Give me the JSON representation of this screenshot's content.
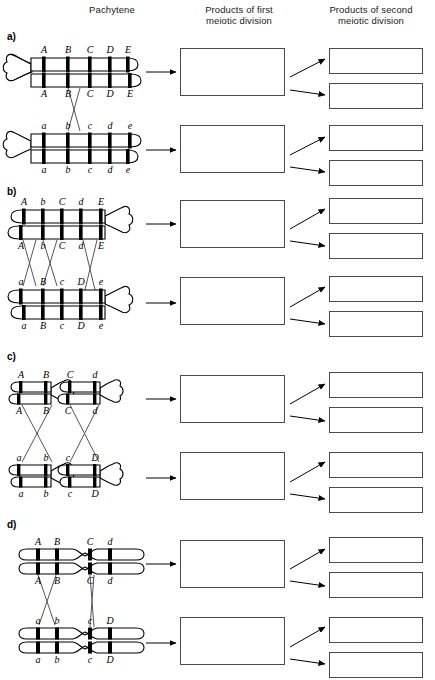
{
  "figure": {
    "headers": {
      "pachytene": "Pachytene",
      "first_division": "Products of first\nmeiotic division",
      "second_division": "Products of second\nmeiotic division"
    },
    "colors": {
      "ink": "#000000",
      "box_border": "#4a4a4a",
      "band": "#000000",
      "outline": "#000000",
      "background": "#ffffff"
    }
  },
  "panels": [
    {
      "id": "a",
      "label": "a)",
      "centromere_position": "left",
      "chromosome_type": "acrocentric",
      "bivalents": [
        {
          "name": "upper-homolog",
          "chromatids": [
            {
              "name": "chromatid-1",
              "alleles": [
                "A",
                "B",
                "C",
                "D",
                "E"
              ],
              "label_position": "above"
            },
            {
              "name": "chromatid-2",
              "alleles": [
                "A",
                "B",
                "C",
                "D",
                "E"
              ],
              "label_position": "below"
            }
          ]
        },
        {
          "name": "lower-homolog",
          "chromatids": [
            {
              "name": "chromatid-3",
              "alleles": [
                "a",
                "b",
                "c",
                "d",
                "e"
              ],
              "label_position": "above"
            },
            {
              "name": "chromatid-4",
              "alleles": [
                "a",
                "b",
                "c",
                "d",
                "e"
              ],
              "label_position": "below"
            }
          ]
        }
      ],
      "crossovers": [
        {
          "name": "crossover-1",
          "between": "B-C"
        }
      ],
      "first_division_boxes": [
        "",
        ""
      ],
      "second_division_boxes": [
        "",
        "",
        "",
        ""
      ]
    },
    {
      "id": "b",
      "label": "b)",
      "centromere_position": "right",
      "chromosome_type": "acrocentric",
      "bivalents": [
        {
          "name": "upper-homolog",
          "chromatids": [
            {
              "name": "chromatid-1",
              "alleles": [
                "A",
                "b",
                "C",
                "d",
                "E"
              ],
              "label_position": "above"
            },
            {
              "name": "chromatid-2",
              "alleles": [
                "A",
                "b",
                "C",
                "d",
                "E"
              ],
              "label_position": "below"
            }
          ]
        },
        {
          "name": "lower-homolog",
          "chromatids": [
            {
              "name": "chromatid-3",
              "alleles": [
                "a",
                "B",
                "c",
                "D",
                "e"
              ],
              "label_position": "above"
            },
            {
              "name": "chromatid-4",
              "alleles": [
                "a",
                "B",
                "c",
                "D",
                "e"
              ],
              "label_position": "below"
            }
          ]
        }
      ],
      "crossovers": [
        {
          "name": "crossover-1",
          "between": "A-b"
        },
        {
          "name": "crossover-2",
          "between": "b-C"
        },
        {
          "name": "crossover-3",
          "between": "d-E"
        }
      ],
      "first_division_boxes": [
        "",
        ""
      ],
      "second_division_boxes": [
        "",
        "",
        "",
        ""
      ]
    },
    {
      "id": "c",
      "label": "c)",
      "centromere_position": "right",
      "chromosome_type": "acrocentric-pair",
      "bivalents": [
        {
          "name": "upper-homolog-left",
          "chromatids": [
            {
              "name": "chromatid-1",
              "alleles": [
                "A",
                "B"
              ],
              "label_position": "above"
            },
            {
              "name": "chromatid-2",
              "alleles": [
                "A",
                "B"
              ],
              "label_position": "below"
            }
          ]
        },
        {
          "name": "upper-homolog-right",
          "chromatids": [
            {
              "name": "chromatid-1",
              "alleles": [
                "C",
                "d"
              ],
              "label_position": "above"
            },
            {
              "name": "chromatid-2",
              "alleles": [
                "C",
                "d"
              ],
              "label_position": "below"
            }
          ]
        },
        {
          "name": "lower-homolog-left",
          "chromatids": [
            {
              "name": "chromatid-3",
              "alleles": [
                "a",
                "b"
              ],
              "label_position": "above"
            },
            {
              "name": "chromatid-4",
              "alleles": [
                "a",
                "b"
              ],
              "label_position": "below"
            }
          ]
        },
        {
          "name": "lower-homolog-right",
          "chromatids": [
            {
              "name": "chromatid-3",
              "alleles": [
                "c",
                "D"
              ],
              "label_position": "above"
            },
            {
              "name": "chromatid-4",
              "alleles": [
                "c",
                "D"
              ],
              "label_position": "below"
            }
          ]
        }
      ],
      "crossovers": [
        {
          "name": "crossover-left",
          "between": "A-B"
        },
        {
          "name": "crossover-right",
          "between": "C-d"
        }
      ],
      "first_division_boxes": [
        "",
        ""
      ],
      "second_division_boxes": [
        "",
        "",
        "",
        ""
      ]
    },
    {
      "id": "d",
      "label": "d)",
      "centromere_position": "middle",
      "chromosome_type": "metacentric",
      "bivalents": [
        {
          "name": "upper-homolog",
          "chromatids": [
            {
              "name": "chromatid-1",
              "alleles": [
                "A",
                "B",
                "C",
                "d"
              ],
              "label_position": "above"
            },
            {
              "name": "chromatid-2",
              "alleles": [
                "A",
                "B",
                "C",
                "d"
              ],
              "label_position": "below"
            }
          ]
        },
        {
          "name": "lower-homolog",
          "chromatids": [
            {
              "name": "chromatid-3",
              "alleles": [
                "a",
                "b",
                "c",
                "D"
              ],
              "label_position": "above"
            },
            {
              "name": "chromatid-4",
              "alleles": [
                "a",
                "b",
                "c",
                "D"
              ],
              "label_position": "below"
            }
          ]
        }
      ],
      "crossovers": [
        {
          "name": "crossover-left",
          "between": "A-B"
        },
        {
          "name": "crossover-right",
          "between": "C-d"
        }
      ],
      "first_division_boxes": [
        "",
        ""
      ],
      "second_division_boxes": [
        "",
        "",
        "",
        ""
      ]
    }
  ]
}
